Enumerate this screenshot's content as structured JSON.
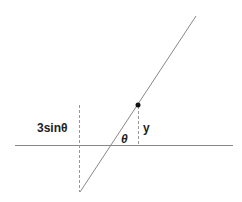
{
  "diagram": {
    "labels": {
      "left_height": "3sinθ",
      "right_height": "y",
      "angle": "θ"
    },
    "colors": {
      "line": "#888888",
      "dashed": "#999999",
      "text": "#222222",
      "point": "#111111"
    }
  }
}
